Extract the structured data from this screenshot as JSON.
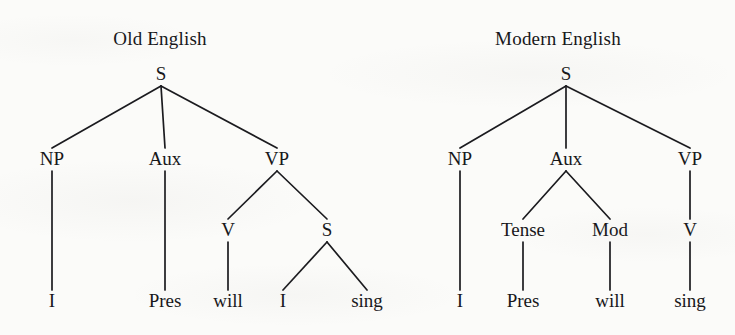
{
  "figure": {
    "kind": "syntax-tree-comparison",
    "background_color": "#fbfbf9",
    "ink_color": "#17171a",
    "width": 735,
    "height": 335
  },
  "trees": [
    {
      "id": "old-english",
      "title": "Old English",
      "title_x": 160,
      "title_y": 45,
      "nodes": [
        {
          "id": "oe-s",
          "label": "S",
          "x": 161,
          "y": 80,
          "type": "nonterminal"
        },
        {
          "id": "oe-np",
          "label": "NP",
          "x": 52,
          "y": 165,
          "type": "nonterminal"
        },
        {
          "id": "oe-aux",
          "label": "Aux",
          "x": 165,
          "y": 165,
          "type": "nonterminal"
        },
        {
          "id": "oe-vp",
          "label": "VP",
          "x": 277,
          "y": 165,
          "type": "nonterminal"
        },
        {
          "id": "oe-v",
          "label": "V",
          "x": 228,
          "y": 236,
          "type": "nonterminal"
        },
        {
          "id": "oe-s2",
          "label": "S",
          "x": 327,
          "y": 236,
          "type": "nonterminal"
        },
        {
          "id": "oe-t-i",
          "label": "I",
          "x": 52,
          "y": 307,
          "type": "terminal"
        },
        {
          "id": "oe-t-pres",
          "label": "Pres",
          "x": 165,
          "y": 307,
          "type": "terminal"
        },
        {
          "id": "oe-t-will",
          "label": "will",
          "x": 228,
          "y": 307,
          "type": "terminal"
        },
        {
          "id": "oe-t-i2",
          "label": "I",
          "x": 283,
          "y": 307,
          "type": "terminal"
        },
        {
          "id": "oe-t-sing",
          "label": "sing",
          "x": 367,
          "y": 307,
          "type": "terminal"
        }
      ],
      "edges": [
        {
          "from": "oe-s",
          "to": "oe-np"
        },
        {
          "from": "oe-s",
          "to": "oe-aux"
        },
        {
          "from": "oe-s",
          "to": "oe-vp"
        },
        {
          "from": "oe-np",
          "to": "oe-t-i"
        },
        {
          "from": "oe-aux",
          "to": "oe-t-pres"
        },
        {
          "from": "oe-vp",
          "to": "oe-v"
        },
        {
          "from": "oe-vp",
          "to": "oe-s2"
        },
        {
          "from": "oe-v",
          "to": "oe-t-will"
        },
        {
          "from": "oe-s2",
          "to": "oe-t-i2"
        },
        {
          "from": "oe-s2",
          "to": "oe-t-sing"
        }
      ]
    },
    {
      "id": "modern-english",
      "title": "Modern English",
      "title_x": 558,
      "title_y": 45,
      "nodes": [
        {
          "id": "me-s",
          "label": "S",
          "x": 566,
          "y": 80,
          "type": "nonterminal"
        },
        {
          "id": "me-np",
          "label": "NP",
          "x": 460,
          "y": 165,
          "type": "nonterminal"
        },
        {
          "id": "me-aux",
          "label": "Aux",
          "x": 566,
          "y": 165,
          "type": "nonterminal"
        },
        {
          "id": "me-vp",
          "label": "VP",
          "x": 690,
          "y": 165,
          "type": "nonterminal"
        },
        {
          "id": "me-tense",
          "label": "Tense",
          "x": 523,
          "y": 236,
          "type": "nonterminal"
        },
        {
          "id": "me-mod",
          "label": "Mod",
          "x": 610,
          "y": 236,
          "type": "nonterminal"
        },
        {
          "id": "me-v",
          "label": "V",
          "x": 690,
          "y": 236,
          "type": "nonterminal"
        },
        {
          "id": "me-t-i",
          "label": "I",
          "x": 460,
          "y": 307,
          "type": "terminal"
        },
        {
          "id": "me-t-pres",
          "label": "Pres",
          "x": 523,
          "y": 307,
          "type": "terminal"
        },
        {
          "id": "me-t-will",
          "label": "will",
          "x": 610,
          "y": 307,
          "type": "terminal"
        },
        {
          "id": "me-t-sing",
          "label": "sing",
          "x": 690,
          "y": 307,
          "type": "terminal"
        }
      ],
      "edges": [
        {
          "from": "me-s",
          "to": "me-np"
        },
        {
          "from": "me-s",
          "to": "me-aux"
        },
        {
          "from": "me-s",
          "to": "me-vp"
        },
        {
          "from": "me-np",
          "to": "me-t-i"
        },
        {
          "from": "me-aux",
          "to": "me-tense"
        },
        {
          "from": "me-aux",
          "to": "me-mod"
        },
        {
          "from": "me-vp",
          "to": "me-v"
        },
        {
          "from": "me-tense",
          "to": "me-t-pres"
        },
        {
          "from": "me-mod",
          "to": "me-t-will"
        },
        {
          "from": "me-v",
          "to": "me-t-sing"
        }
      ]
    }
  ]
}
